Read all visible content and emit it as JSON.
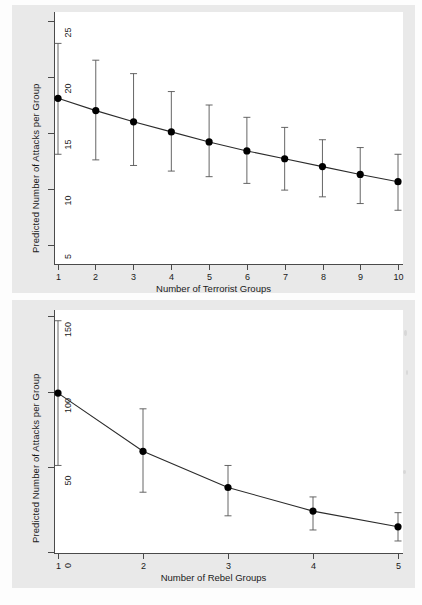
{
  "figure": {
    "background": "#e9e9e9",
    "plot_background": "#ffffff",
    "line_color": "#333333",
    "marker_color": "#000000"
  },
  "charts": [
    {
      "id": "terrorist-groups-chart",
      "title": "",
      "xlabel": "Number of Terrorist Groups",
      "ylabel": "Predicted Number of Attacks per Group",
      "xticks": [
        "1",
        "2",
        "3",
        "4",
        "5",
        "6",
        "7",
        "8",
        "9",
        "10"
      ],
      "yticks": [
        "5",
        "10",
        "15",
        "20",
        "25"
      ]
    },
    {
      "id": "rebel-groups-chart",
      "title": "",
      "xlabel": "Number of Rebel Groups",
      "ylabel": "Predicted Number of Attacks per Group",
      "xticks": [
        "1",
        "2",
        "3",
        "4",
        "5"
      ],
      "yticks": [
        "0",
        "50",
        "100",
        "150"
      ]
    }
  ],
  "chart_data": [
    {
      "type": "line",
      "id": "terrorist-groups-chart",
      "title": "",
      "xlabel": "Number of Terrorist Groups",
      "ylabel": "Predicted Number of Attacks per Group",
      "x": [
        1,
        2,
        3,
        4,
        5,
        6,
        7,
        8,
        9,
        10
      ],
      "values": [
        18.1,
        17.0,
        16.0,
        15.1,
        14.2,
        13.4,
        12.7,
        12.0,
        11.3,
        10.65
      ],
      "ci_upper": [
        23.0,
        21.5,
        20.3,
        18.7,
        17.5,
        16.4,
        15.5,
        14.4,
        13.7,
        13.1
      ],
      "ci_lower": [
        13.1,
        12.6,
        12.1,
        11.6,
        11.1,
        10.5,
        9.9,
        9.3,
        8.7,
        8.1
      ],
      "xlim": [
        1,
        10
      ],
      "ylim": [
        5,
        25
      ],
      "yticks": [
        5,
        10,
        15,
        20,
        25
      ],
      "xticks": [
        1,
        2,
        3,
        4,
        5,
        6,
        7,
        8,
        9,
        10
      ],
      "grid": false,
      "legend": null,
      "error_bars": "95% confidence interval",
      "marker": "filled-circle"
    },
    {
      "type": "line",
      "id": "rebel-groups-chart",
      "title": "",
      "xlabel": "Number of Rebel Groups",
      "ylabel": "Predicted Number of Attacks per Group",
      "x": [
        1,
        2,
        3,
        4,
        5
      ],
      "values": [
        101,
        64,
        41,
        26,
        16
      ],
      "ci_upper": [
        147,
        91,
        55,
        35,
        25
      ],
      "ci_lower": [
        55,
        38,
        23,
        14,
        7
      ],
      "xlim": [
        1,
        5
      ],
      "ylim": [
        0,
        150
      ],
      "yticks": [
        0,
        50,
        100,
        150
      ],
      "xticks": [
        1,
        2,
        3,
        4,
        5
      ],
      "grid": false,
      "legend": null,
      "error_bars": "95% confidence interval",
      "marker": "filled-circle"
    }
  ]
}
